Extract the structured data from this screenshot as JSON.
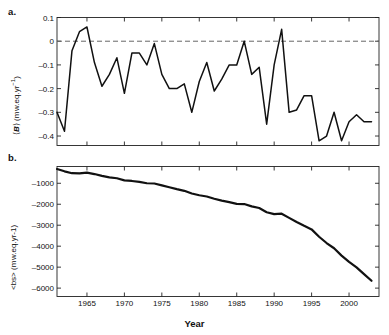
{
  "figure": {
    "panel_a_letter": "a.",
    "panel_b_letter": "b.",
    "xlabel": "Year"
  },
  "chart_data": [
    {
      "type": "line",
      "panel": "a",
      "title": "",
      "xlabel": "",
      "ylabel": "⟨Ḃ⟩ (m w.eq.yr⁻¹)",
      "ylabel_plain": "<B> (m w.eq.yr-1)",
      "xlim": [
        1961,
        2004
      ],
      "ylim": [
        -0.44,
        0.1
      ],
      "grid": false,
      "legend": null,
      "xticks": [
        1965,
        1970,
        1975,
        1980,
        1985,
        1990,
        1995,
        2000
      ],
      "yticks": [
        0.1,
        0,
        -0.1,
        -0.2,
        -0.3,
        -0.4
      ],
      "ytick_labels": [
        "0.1",
        "0",
        "–0.1",
        "–0.2",
        "–0.3",
        "–0.4"
      ],
      "annotations": [
        {
          "kind": "hline",
          "y": 0,
          "style": "dashed",
          "color": "#666666"
        }
      ],
      "x": [
        1961,
        1962,
        1963,
        1964,
        1965,
        1966,
        1967,
        1968,
        1969,
        1970,
        1971,
        1972,
        1973,
        1974,
        1975,
        1976,
        1977,
        1978,
        1979,
        1980,
        1981,
        1982,
        1983,
        1984,
        1985,
        1986,
        1987,
        1988,
        1989,
        1990,
        1991,
        1992,
        1993,
        1994,
        1995,
        1996,
        1997,
        1998,
        1999,
        2000,
        2001,
        2002,
        2003
      ],
      "values": [
        -0.3,
        -0.38,
        -0.04,
        0.04,
        0.06,
        -0.09,
        -0.19,
        -0.14,
        -0.07,
        -0.22,
        -0.05,
        -0.05,
        -0.1,
        -0.01,
        -0.14,
        -0.2,
        -0.2,
        -0.18,
        -0.3,
        -0.17,
        -0.09,
        -0.21,
        -0.16,
        -0.1,
        -0.1,
        0.0,
        -0.14,
        -0.11,
        -0.35,
        -0.1,
        0.05,
        -0.3,
        -0.29,
        -0.23,
        -0.23,
        -0.42,
        -0.4,
        -0.3,
        -0.42,
        -0.34,
        -0.31,
        -0.34,
        -0.34
      ]
    },
    {
      "type": "line",
      "panel": "b",
      "title": "",
      "xlabel": "Year",
      "ylabel": "<bs> (m w.eq.yr-1)",
      "xlim": [
        1961,
        2004
      ],
      "ylim": [
        -6400,
        -200
      ],
      "grid": false,
      "legend": null,
      "xticks": [
        1965,
        1970,
        1975,
        1980,
        1985,
        1990,
        1995,
        2000
      ],
      "yticks": [
        -1000,
        -2000,
        -3000,
        -4000,
        -5000,
        -6000
      ],
      "ytick_labels": [
        "–1000",
        "–2000",
        "–3000",
        "–4000",
        "–5000",
        "–6000"
      ],
      "x": [
        1961,
        1962,
        1963,
        1964,
        1965,
        1966,
        1967,
        1968,
        1969,
        1970,
        1971,
        1972,
        1973,
        1974,
        1975,
        1976,
        1977,
        1978,
        1979,
        1980,
        1981,
        1982,
        1983,
        1984,
        1985,
        1986,
        1987,
        1988,
        1989,
        1990,
        1991,
        1992,
        1993,
        1994,
        1995,
        1996,
        1997,
        1998,
        1999,
        2000,
        2001,
        2002,
        2003
      ],
      "values": [
        -320,
        -430,
        -520,
        -530,
        -490,
        -560,
        -650,
        -720,
        -760,
        -860,
        -890,
        -930,
        -1000,
        -1010,
        -1100,
        -1190,
        -1280,
        -1360,
        -1490,
        -1570,
        -1630,
        -1740,
        -1830,
        -1900,
        -1980,
        -1990,
        -2100,
        -2180,
        -2380,
        -2470,
        -2450,
        -2650,
        -2850,
        -3030,
        -3200,
        -3550,
        -3850,
        -4100,
        -4450,
        -4750,
        -5010,
        -5330,
        -5650
      ]
    }
  ]
}
